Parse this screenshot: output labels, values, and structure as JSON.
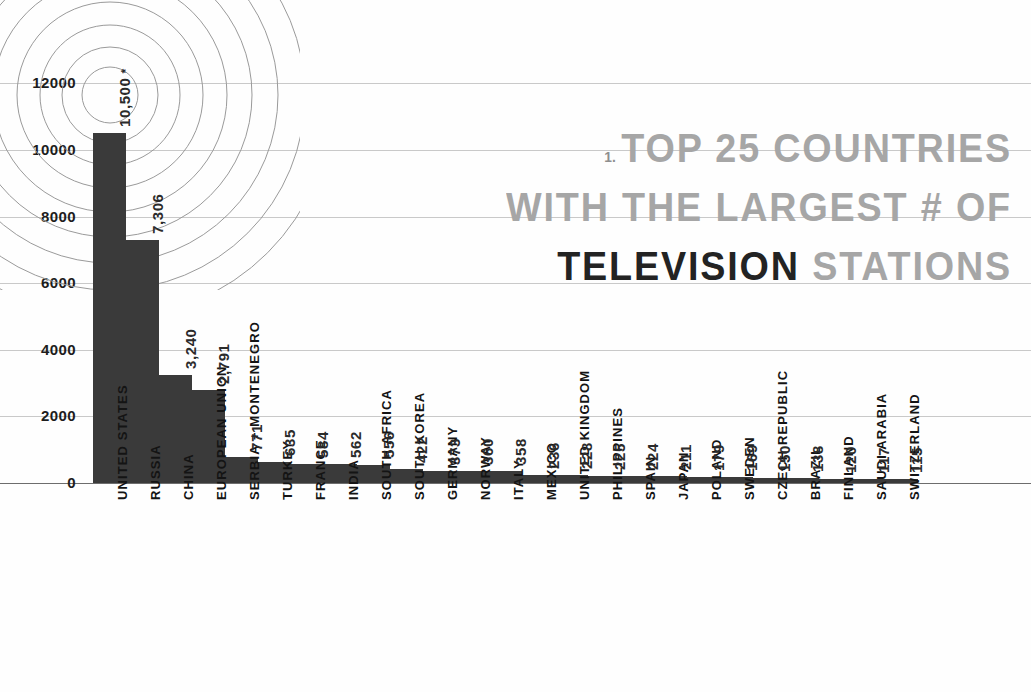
{
  "title": {
    "number": "1.",
    "line1": "TOP 25 COUNTRIES",
    "line2": "WITH THE LARGEST # OF",
    "line3_highlight": "TELEVISION",
    "line3_rest": "STATIONS"
  },
  "colors": {
    "bar": "#3a3a3a",
    "gridline": "#c9c9c9",
    "axis": "#6d6d6d",
    "title_muted": "#a6a6a6",
    "title_highlight": "#232323",
    "wave": "#9a9a9a"
  },
  "chart_data": {
    "type": "bar",
    "xlabel": "",
    "ylabel": "",
    "ylim": [
      0,
      12800
    ],
    "grid": true,
    "legend": "none",
    "yticks": [
      0,
      2000,
      4000,
      6000,
      8000,
      10000,
      12000
    ],
    "ytick_labels": [
      "0",
      "2000",
      "4000",
      "6000",
      "8000",
      "10000",
      "12000"
    ],
    "categories": [
      "UNITED STATES",
      "RUSSIA",
      "CHINA",
      "EUROPEAN UNION",
      "SERBIA + MONTENEGRO",
      "TURKEY",
      "FRANCE",
      "INDIA",
      "SOUTH AFRICA",
      "SOUTH KOREA",
      "GERMANY",
      "NORWAY",
      "ITALY",
      "MEXICO",
      "UNITED KINGDOM",
      "PHILIPPINES",
      "SPAIN",
      "JAPAN",
      "POLAND",
      "SWEDEN",
      "CZECH REPUBLIC",
      "BRAZIL",
      "FINLAND",
      "SAUDI ARABIA",
      "SWITZERLAND"
    ],
    "values": [
      10500,
      7306,
      3240,
      2791,
      771,
      635,
      584,
      562,
      556,
      422,
      373,
      360,
      358,
      236,
      228,
      225,
      224,
      211,
      179,
      169,
      150,
      138,
      120,
      117,
      115
    ],
    "value_labels": [
      "10,500",
      "7,306",
      "3,240",
      "2,791",
      "771",
      "635",
      "584",
      "562",
      "556",
      "422",
      "373",
      "360",
      "358",
      "236",
      "228",
      "225",
      "224",
      "211",
      "179",
      "169",
      "150",
      "138",
      "120",
      "117",
      "115"
    ],
    "footnote_marker": "*",
    "footnote_on_index": 0
  }
}
